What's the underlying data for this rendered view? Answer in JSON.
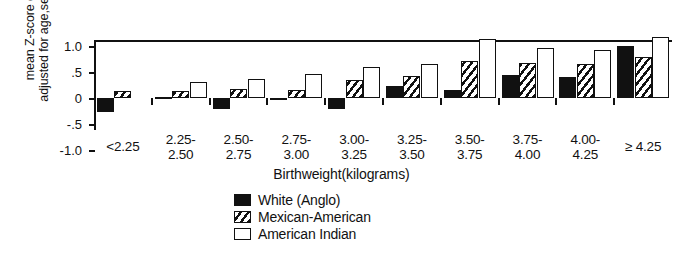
{
  "chart_data": {
    "type": "bar",
    "title": "",
    "xlabel": "Birthweight(kilograms)",
    "ylabel_line1": "mean Z-score of weight",
    "ylabel_line2": "adjusted for age,sex,and length",
    "ylim": [
      -1.0,
      1.3
    ],
    "yticks": [
      {
        "value": 1.0,
        "label": "1.0"
      },
      {
        "value": 0.5,
        "label": ".5"
      },
      {
        "value": 0.0,
        "label": "0"
      },
      {
        "value": -0.5,
        "label": "-.5"
      },
      {
        "value": -1.0,
        "label": "-1.0"
      }
    ],
    "grid": false,
    "legend_position": "bottom-center",
    "categories": [
      "<2.25",
      "2.25-\n2.50",
      "2.50-\n2.75",
      "2.75-\n3.00",
      "3.00-\n3.25",
      "3.25-\n3.50",
      "3.50-\n3.75",
      "3.75-\n4.00",
      "4.00-\n4.25",
      "≥ 4.25"
    ],
    "category_labels": [
      {
        "line1": "<2.25",
        "line2": ""
      },
      {
        "line1": "2.25-",
        "line2": "2.50"
      },
      {
        "line1": "2.50-",
        "line2": "2.75"
      },
      {
        "line1": "2.75-",
        "line2": "3.00"
      },
      {
        "line1": "3.00-",
        "line2": "3.25"
      },
      {
        "line1": "3.25-",
        "line2": "3.50"
      },
      {
        "line1": "3.50-",
        "line2": "3.75"
      },
      {
        "line1": "3.75-",
        "line2": "4.00"
      },
      {
        "line1": "4.00-",
        "line2": "4.25"
      },
      {
        "line1": "≥ 4.25",
        "line2": ""
      }
    ],
    "series": [
      {
        "name": "White (Anglo)",
        "fill": "solid-black",
        "color": "#111111",
        "values": [
          -0.27,
          -0.02,
          -0.21,
          -0.03,
          -0.22,
          0.23,
          0.16,
          0.45,
          0.4,
          1.0
        ]
      },
      {
        "name": "Mexican-American",
        "fill": "hatched",
        "color": "#111111",
        "values": [
          0.13,
          0.13,
          0.17,
          0.15,
          0.34,
          0.43,
          0.72,
          0.67,
          0.66,
          0.78
        ]
      },
      {
        "name": "American Indian",
        "fill": "white-outline",
        "color": "#ffffff",
        "values": [
          null,
          0.31,
          0.37,
          0.46,
          0.59,
          0.66,
          1.14,
          0.97,
          0.93,
          1.18
        ]
      }
    ]
  },
  "legend": {
    "items": [
      {
        "label": "White (Anglo)",
        "key": "white-anglo"
      },
      {
        "label": "Mexican-American",
        "key": "mexican-american"
      },
      {
        "label": "American Indian",
        "key": "american-indian"
      }
    ]
  }
}
